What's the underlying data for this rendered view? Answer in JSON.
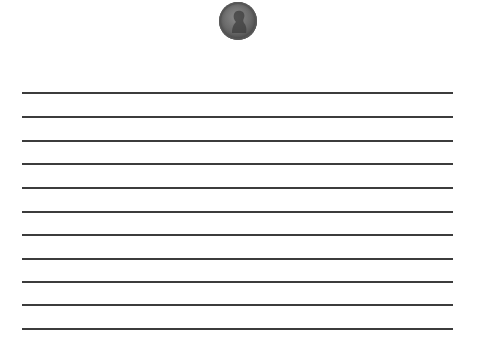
{
  "page": {
    "background": "#ffffff",
    "header_image": {
      "icon": "penny-coin-icon",
      "description": "US one-cent coin (Lincoln profile)",
      "color": "#6a6a6a"
    },
    "ruled_lines": {
      "count": 11,
      "color": "#3c3c3c",
      "x_start": 22,
      "x_end": 453,
      "y_positions": [
        92,
        116,
        140,
        163,
        187,
        211,
        234,
        258,
        281,
        304,
        328
      ]
    }
  }
}
